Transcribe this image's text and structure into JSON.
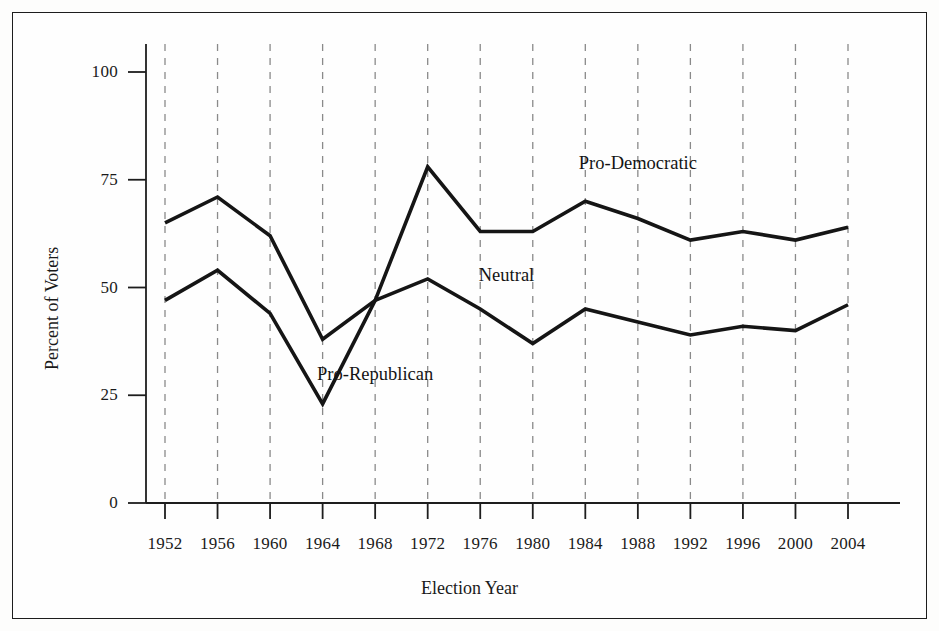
{
  "chart_data": {
    "type": "line",
    "title": "",
    "xlabel": "Election Year",
    "ylabel": "Percent of Voters",
    "x": [
      1952,
      1956,
      1960,
      1964,
      1968,
      1972,
      1976,
      1980,
      1984,
      1988,
      1992,
      1996,
      2000,
      2004
    ],
    "xtick_labels": [
      "1952",
      "1956",
      "1960",
      "1964",
      "1968",
      "1972",
      "1976",
      "1980",
      "1984",
      "1988",
      "1992",
      "1996",
      "2000",
      "2004"
    ],
    "ytick_labels": [
      "0",
      "25",
      "50",
      "75",
      "100"
    ],
    "yticks": [
      0,
      25,
      50,
      75,
      100
    ],
    "ylim": [
      0,
      100
    ],
    "xlim": [
      1952,
      2004
    ],
    "grid": "vertical-dashed",
    "legend": "none",
    "series": [
      {
        "name": "Pro-Democratic boundary (upper)",
        "values": [
          65,
          71,
          62,
          38,
          47,
          78,
          63,
          63,
          70,
          66,
          61,
          63,
          61,
          64
        ]
      },
      {
        "name": "Pro-Republican boundary (lower)",
        "values": [
          47,
          54,
          44,
          23,
          47,
          52,
          45,
          37,
          45,
          42,
          39,
          41,
          40,
          46
        ]
      }
    ],
    "annotations": [
      {
        "text": "Pro-Democratic",
        "x": 1988,
        "y": 79,
        "region": "above-upper-line"
      },
      {
        "text": "Neutral",
        "x": 1978,
        "y": 53,
        "region": "between-lines"
      },
      {
        "text": "Pro-Republican",
        "x": 1968,
        "y": 30,
        "region": "below-lower-line"
      }
    ],
    "colors": {
      "line": "#151515",
      "gridline": "#8a8a8a",
      "axis": "#1d1d1d",
      "background": "#fefefe",
      "frame": "#1d1d1d"
    }
  }
}
